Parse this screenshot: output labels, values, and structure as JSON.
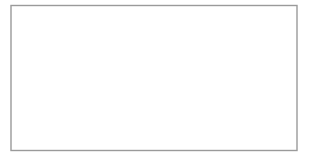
{
  "figure": {
    "canvas": {
      "width": 309,
      "height": 162,
      "background": "#ffffff"
    }
  },
  "frame": {
    "name": "outer-frame",
    "x": 11,
    "y": 5.5,
    "width": 286,
    "height": 145,
    "stroke": "#9a9a9a",
    "stroke_width": 1.4,
    "fill": "#ffffff"
  },
  "dividers": {
    "stroke": "#8f8f8f",
    "stroke_width": 1.2,
    "positions": [
      67.5,
      152.5,
      233.5
    ]
  },
  "bands": {
    "shade_fill": "#f0f0f0",
    "shade_fill_soft": "#f4f4f4",
    "void_fill": "#ffffff",
    "dash_stroke": "#a8a8a8",
    "dash_width": 1.1,
    "dash_pattern": "2.2 2.2",
    "period": 82,
    "wave_amplitude": 30,
    "dashed_arc_base_x": [
      40,
      123,
      205,
      288
    ],
    "void_center_x": [
      100,
      182,
      264
    ],
    "void_half_width": 26
  },
  "legend": {
    "shade_label": "shaded band",
    "void_label": "white lens void",
    "dash_label": "dashed wave boundary",
    "divider_label": "panel divider"
  }
}
